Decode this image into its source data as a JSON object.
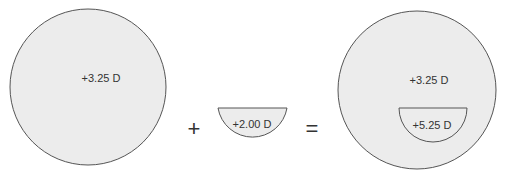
{
  "diagram": {
    "colors": {
      "fill": "#ececec",
      "stroke": "#555555",
      "text": "#333333"
    },
    "distance_lens": {
      "label": "+3.25 D"
    },
    "plus_sign": "+",
    "segment": {
      "label": "+2.00 D"
    },
    "equals_sign": "=",
    "result_lens": {
      "distance_label": "+3.25 D",
      "segment_label": "+5.25 D"
    }
  }
}
